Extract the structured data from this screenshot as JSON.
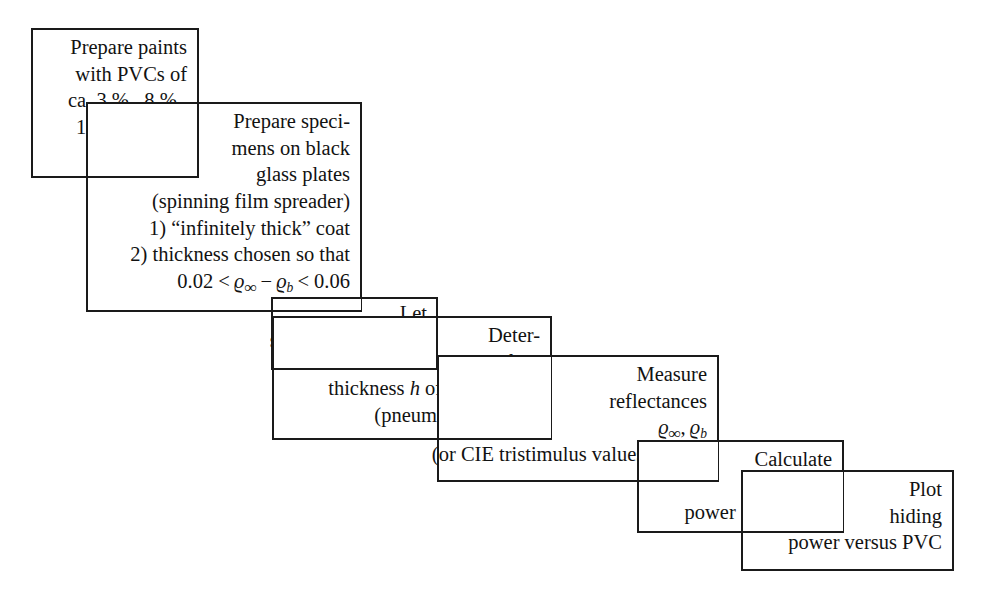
{
  "diagram": {
    "type": "cascading-flowchart",
    "orientation": "left-to-right descending staircase",
    "background_color": "#ffffff",
    "line_color": "#1a1a1a",
    "text_color": "#121212",
    "step_count": 7
  },
  "steps": [
    {
      "id": "step-1",
      "name": "prepare-paints",
      "lines": [
        "Prepare paints",
        "with PVCs of",
        "ca. 3 % , 8 % ,",
        "13 % , 20 % ,",
        "30 % , 40 %"
      ]
    },
    {
      "id": "step-2",
      "name": "prepare-specimens",
      "lines": [
        "Prepare speci-",
        "mens on black",
        "glass plates",
        "(spinning film spreader)",
        "1) “infinitely thick” coat",
        "2) thickness chosen so that",
        "0.02 < ϱ∞ − ϱb < 0.06"
      ]
    },
    {
      "id": "step-3",
      "name": "dry-specimen-films",
      "lines": [
        "Let",
        "specimen films dry"
      ]
    },
    {
      "id": "step-4",
      "name": "determine-film-thickness",
      "lines": [
        "Deter-",
        "mine film",
        "thickness h of specimen 2",
        "(pneumatic method)"
      ]
    },
    {
      "id": "step-5",
      "name": "measure-reflectances",
      "lines": [
        "Measure",
        "reflectances",
        "ϱ∞, ϱb",
        "(or CIE tristimulus values Y∞, Yb)"
      ]
    },
    {
      "id": "step-6",
      "name": "calculate-hiding-power",
      "lines": [
        "Calculate",
        "hiding",
        "power (computer)"
      ]
    },
    {
      "id": "step-7",
      "name": "plot-hiding-power",
      "lines": [
        "Plot",
        "hiding",
        "power versus PVC"
      ]
    }
  ],
  "step1": {
    "l1": "Prepare paints",
    "l2": "with PVCs of",
    "l3": "ca. 3 % , 8 % ,",
    "l4": "13 % , 20 % ,",
    "l5": "30 % , 40 %"
  },
  "step2": {
    "l1": "Prepare speci-",
    "l2": "mens on black",
    "l3": "glass plates",
    "l4": "(spinning film spreader)",
    "l5": "1) “infinitely thick” coat",
    "l6": "2) thickness chosen so that"
  },
  "step3": {
    "l1": "Let",
    "l2": "specimen films dry"
  },
  "step4": {
    "l1": "Deter-",
    "l2": "mine film",
    "l4": "(pneumatic method)"
  },
  "step5": {
    "l1": "Measure",
    "l2": "reflectances"
  },
  "step6": {
    "l1": "Calculate",
    "l2": "hiding",
    "l3": "power (computer)"
  },
  "step7": {
    "l1": "Plot",
    "l2": "hiding",
    "l3": "power versus PVC"
  },
  "formulas": {
    "inequality_lead": "0.02 <",
    "inequality_tail": "< 0.06",
    "rho_symbol": "ϱ",
    "infinity_symbol": "∞",
    "b_subscript": "b",
    "minus": "−",
    "thickness_lead": "thickness",
    "thickness_h": "h",
    "thickness_tail": "of specimen 2",
    "tristimulus_lead": "(or CIE tristimulus values",
    "Y_symbol": "Y",
    "comma": ",",
    "paren_close": ")"
  }
}
